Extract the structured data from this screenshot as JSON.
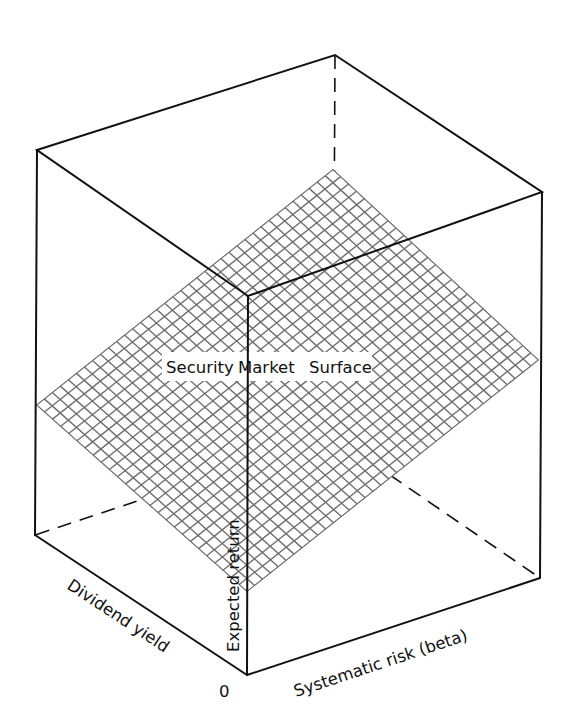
{
  "diagram": {
    "title": "Security Market Surface",
    "surface_label_words": [
      "Security",
      "Market",
      "Surface"
    ],
    "axes": {
      "vertical": "Expected return",
      "left": "Dividend yield",
      "right": "Systematic risk (beta)",
      "origin": "0"
    },
    "colors": {
      "lines": "#111111",
      "grid": "#707070",
      "background": "#ffffff"
    }
  }
}
